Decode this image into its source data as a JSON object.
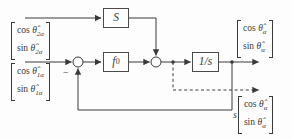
{
  "figure": {
    "background": "#fdfdfd",
    "line_color": "#3a3a3a",
    "blocks": {
      "s_gain": {
        "label": "S"
      },
      "f0": {
        "base": "f",
        "sub": "0"
      },
      "integrator": {
        "label": "1/s"
      }
    },
    "junctions": {
      "feedback_sign": "−"
    },
    "vectors": {
      "input_2a": {
        "r1fn": "cos",
        "r1sym": "θ̂",
        "r1sub": "2α",
        "r2fn": "sin",
        "r2sym": "θ̂",
        "r2sub": "2α"
      },
      "input_1a": {
        "r1fn": "cos",
        "r1sym": "θ̂",
        "r1sub": "1α",
        "r2fn": "sin",
        "r2sym": "θ̂",
        "r2sub": "1α"
      },
      "output": {
        "r1fn": "cos",
        "r1sym": "θ̂",
        "r1sub": "α",
        "r2fn": "sin",
        "r2sym": "θ̂",
        "r2sub": "α"
      },
      "derivative": {
        "coeff": "s",
        "r1fn": "cos",
        "r1sym": "θ̂",
        "r1sub": "α",
        "r2fn": "sin",
        "r2sym": "θ̂",
        "r2sub": "α"
      }
    }
  }
}
